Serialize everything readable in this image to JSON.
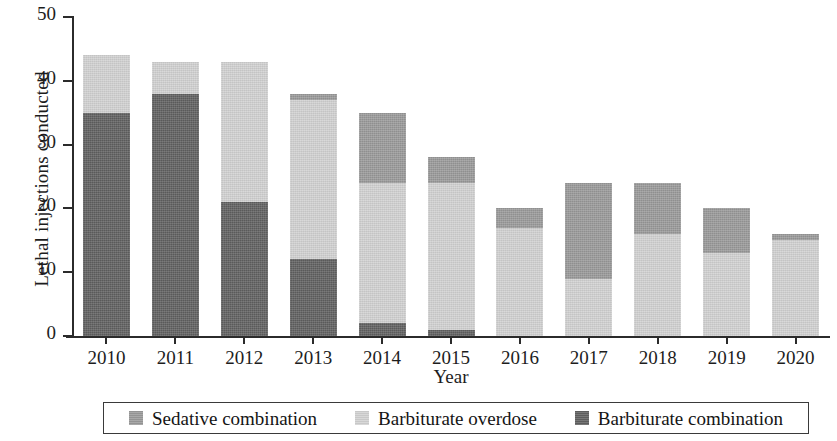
{
  "chart_data": {
    "type": "bar",
    "subtype": "stacked-bar",
    "title": "",
    "xlabel": "Year",
    "ylabel": "Lethal injections conducted",
    "categories": [
      "2010",
      "2011",
      "2012",
      "2013",
      "2014",
      "2015",
      "2016",
      "2017",
      "2018",
      "2019",
      "2020"
    ],
    "ylim": [
      0,
      50
    ],
    "yticks": [
      0,
      10,
      20,
      30,
      40,
      50
    ],
    "grid": false,
    "legend_position": "bottom",
    "stack_order_bottom_to_top": [
      "Barbiturate combination",
      "Barbiturate overdose",
      "Sedative combination"
    ],
    "series": [
      {
        "name": "Barbiturate combination",
        "color": "#616161",
        "values": [
          35,
          38,
          21,
          12,
          2,
          1,
          0,
          0,
          0,
          0,
          0
        ]
      },
      {
        "name": "Barbiturate overdose",
        "color": "#d2d2d2",
        "values": [
          9,
          5,
          22,
          25,
          22,
          23,
          17,
          9,
          16,
          13,
          15
        ]
      },
      {
        "name": "Sedative combination",
        "color": "#9a9a9a",
        "values": [
          0,
          0,
          0,
          1,
          11,
          4,
          3,
          15,
          8,
          7,
          1
        ]
      }
    ],
    "totals": [
      44,
      43,
      43,
      38,
      35,
      28,
      20,
      24,
      24,
      20,
      16
    ]
  },
  "legend": {
    "items": [
      {
        "label": "Sedative combination",
        "color": "#9a9a9a"
      },
      {
        "label": "Barbiturate overdose",
        "color": "#d2d2d2"
      },
      {
        "label": "Barbiturate combination",
        "color": "#616161"
      }
    ]
  }
}
